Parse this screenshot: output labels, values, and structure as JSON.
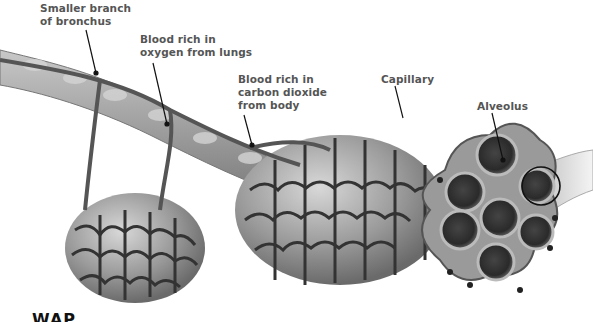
{
  "figure": {
    "labels": [
      {
        "id": "bronchus",
        "text": "Smaller branch\nof bronchus"
      },
      {
        "id": "oxygen-blood",
        "text": "Blood rich in\noxygen from lungs"
      },
      {
        "id": "co2-blood",
        "text": "Blood rich in\ncarbon dioxide\nfrom body"
      },
      {
        "id": "capillary",
        "text": "Capillary"
      },
      {
        "id": "alveolus",
        "text": "Alveolus"
      }
    ],
    "cutoff_text": "WAP",
    "colors": {
      "label_text": "#555555",
      "vessel": "#555555",
      "vessel_outline": "#2a2a2a",
      "bronchus": "#9a9a9a",
      "alveolus_fill": "#8a8a8a",
      "alveolus_dark": "#333333",
      "highlight_circle": "#111111"
    }
  }
}
